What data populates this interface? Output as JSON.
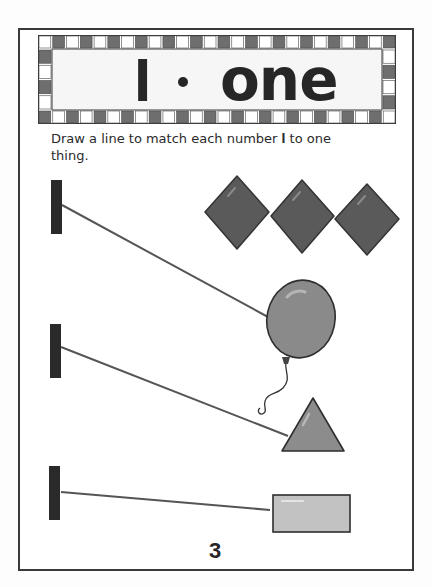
{
  "page": {
    "title": {
      "numeral": "I",
      "separator": "•",
      "word": "one"
    },
    "instructions": {
      "before": "Draw a line to match each number ",
      "numeral": "I",
      "after": " to one thing."
    },
    "page_number": "3"
  },
  "rows": [
    {
      "numeral_label": "1",
      "matched_item": "three diamonds",
      "matched_to": "balloon"
    },
    {
      "numeral_label": "1",
      "matched_to": "triangle"
    },
    {
      "numeral_label": "1",
      "matched_to": "rectangle"
    }
  ],
  "items": [
    {
      "name": "diamond",
      "count": 3
    },
    {
      "name": "balloon",
      "count": 1
    },
    {
      "name": "triangle",
      "count": 1
    },
    {
      "name": "rectangle",
      "count": 1
    }
  ],
  "colors": {
    "ink": "#262626",
    "frame": "#3a3a3a",
    "checker_dark": "#6e6e6e",
    "checker_light": "#ffffff",
    "diamond_fill": "#5a5a5a",
    "balloon_fill": "#8a8a8a",
    "triangle_fill": "#8c8c8c",
    "rectangle_fill": "#c2c2c2",
    "line": "#555555"
  }
}
